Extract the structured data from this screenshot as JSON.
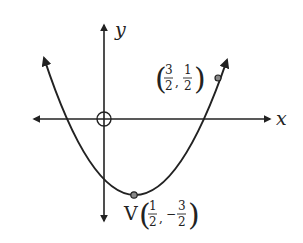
{
  "diagram": {
    "type": "parabola-graph",
    "axes": {
      "x_label": "x",
      "y_label": "y"
    },
    "origin_marker": "circle",
    "curve": "upward parabola with arrows at both ends",
    "points": [
      {
        "name": "vertex",
        "prefix": "V",
        "x_num": "1",
        "x_den": "2",
        "x_sign": "",
        "y_num": "3",
        "y_den": "2",
        "y_sign": "−"
      },
      {
        "name": "point",
        "prefix": "",
        "x_num": "3",
        "x_den": "2",
        "x_sign": "",
        "y_num": "1",
        "y_den": "2",
        "y_sign": ""
      }
    ],
    "colors": {
      "ink": "#222222",
      "point_fill": "#888888",
      "background": "#ffffff"
    }
  }
}
